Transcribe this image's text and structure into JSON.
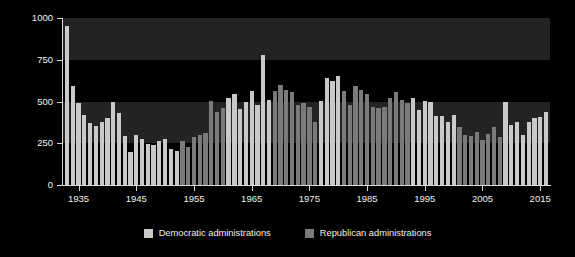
{
  "chart_data": {
    "type": "bar",
    "title": "",
    "xlabel": "",
    "ylabel": "TOTAL UNILATERAL ACTIONS",
    "ylim": [
      0,
      1000
    ],
    "xlim": [
      1932.3,
      2016.7
    ],
    "yticks": [
      0,
      250,
      500,
      750,
      1000
    ],
    "ytick_labels": [
      "0",
      "250",
      "500",
      "750",
      "1000"
    ],
    "xticks": [
      1935,
      1945,
      1955,
      1965,
      1975,
      1985,
      1995,
      2005,
      2015
    ],
    "xtick_labels": [
      "1935",
      "1945",
      "1955",
      "1965",
      "1975",
      "1985",
      "1995",
      "2005",
      "2015"
    ],
    "grid": false,
    "background_bands": [
      {
        "from": 250,
        "to": 500
      },
      {
        "from": 750,
        "to": 1000
      }
    ],
    "legend_position": "below",
    "legend": [
      {
        "label": "Democratic administrations",
        "color": "#c9c9c9"
      },
      {
        "label": "Republican administrations",
        "color": "#7a7a7a"
      }
    ],
    "categories": [
      1933,
      1934,
      1935,
      1936,
      1937,
      1938,
      1939,
      1940,
      1941,
      1942,
      1943,
      1944,
      1945,
      1946,
      1947,
      1948,
      1949,
      1950,
      1951,
      1952,
      1953,
      1954,
      1955,
      1956,
      1957,
      1958,
      1959,
      1960,
      1961,
      1962,
      1963,
      1964,
      1965,
      1966,
      1967,
      1968,
      1969,
      1970,
      1971,
      1972,
      1973,
      1974,
      1975,
      1976,
      1977,
      1978,
      1979,
      1980,
      1981,
      1982,
      1983,
      1984,
      1985,
      1986,
      1987,
      1988,
      1989,
      1990,
      1991,
      1992,
      1993,
      1994,
      1995,
      1996,
      1997,
      1998,
      1999,
      2000,
      2001,
      2002,
      2003,
      2004,
      2005,
      2006,
      2007,
      2008,
      2009,
      2010,
      2011,
      2012,
      2013,
      2014,
      2015,
      2016
    ],
    "values": [
      950,
      590,
      490,
      420,
      370,
      355,
      380,
      400,
      500,
      430,
      295,
      200,
      300,
      275,
      245,
      240,
      265,
      275,
      215,
      205,
      265,
      230,
      285,
      300,
      310,
      505,
      440,
      460,
      520,
      545,
      455,
      500,
      560,
      480,
      780,
      510,
      560,
      600,
      570,
      555,
      480,
      490,
      470,
      380,
      505,
      640,
      620,
      650,
      560,
      480,
      590,
      570,
      545,
      470,
      460,
      470,
      520,
      555,
      510,
      490,
      520,
      450,
      505,
      500,
      415,
      415,
      380,
      420,
      350,
      300,
      295,
      320,
      270,
      305,
      345,
      290,
      500,
      360,
      380,
      300,
      380,
      400,
      410,
      440
    ],
    "parties": [
      "D",
      "D",
      "D",
      "D",
      "D",
      "D",
      "D",
      "D",
      "D",
      "D",
      "D",
      "D",
      "D",
      "D",
      "D",
      "D",
      "D",
      "D",
      "D",
      "D",
      "R",
      "R",
      "R",
      "R",
      "R",
      "R",
      "R",
      "R",
      "D",
      "D",
      "D",
      "D",
      "D",
      "D",
      "D",
      "D",
      "R",
      "R",
      "R",
      "R",
      "R",
      "R",
      "R",
      "R",
      "D",
      "D",
      "D",
      "D",
      "R",
      "R",
      "R",
      "R",
      "R",
      "R",
      "R",
      "R",
      "R",
      "R",
      "R",
      "R",
      "D",
      "D",
      "D",
      "D",
      "D",
      "D",
      "D",
      "D",
      "R",
      "R",
      "R",
      "R",
      "R",
      "R",
      "R",
      "R",
      "D",
      "D",
      "D",
      "D",
      "D",
      "D",
      "D",
      "D"
    ]
  }
}
